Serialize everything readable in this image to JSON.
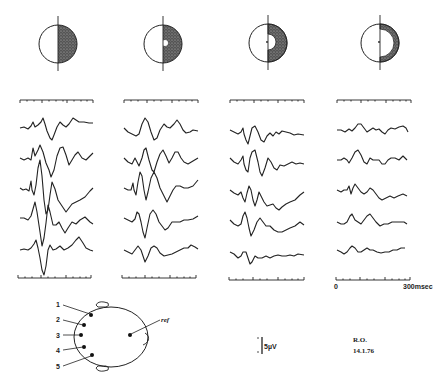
{
  "figure": {
    "stimulus_fields": [
      {
        "label": "full half-field",
        "column": 1
      },
      {
        "label": "half-field, small central mask",
        "column": 2
      },
      {
        "label": "half-field, medium central mask",
        "column": 3
      },
      {
        "label": "half-field annulus, large central mask",
        "column": 4
      }
    ],
    "time_axis": {
      "start_label": "0",
      "end_label": "300msec"
    },
    "amplitude_scale": {
      "label": "5µV"
    },
    "electrode_montage": {
      "electrodes": [
        "1",
        "2",
        "3",
        "4",
        "5"
      ],
      "reference_label": "ref"
    },
    "annotation": {
      "subject": "R.O.",
      "date": "14.1.76"
    }
  }
}
